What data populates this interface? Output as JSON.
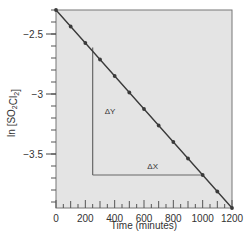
{
  "chart_data": {
    "type": "line",
    "title": "",
    "xlabel": "Time (minutes)",
    "ylabel": "ln [SO2Cl2]",
    "ylabel_parts": {
      "pre": "ln [SO",
      "sub1": "2",
      "mid": "Cl",
      "sub2": "2",
      "post": "]"
    },
    "xlim": [
      0,
      1200
    ],
    "ylim": [
      -3.95,
      -2.3
    ],
    "x_ticks": [
      0,
      200,
      400,
      600,
      800,
      1000,
      1200
    ],
    "x_tick_labels": [
      "0",
      "200",
      "400",
      "600",
      "800",
      "1000",
      "1200"
    ],
    "x_minor_step": 50,
    "y_ticks": [
      -2.5,
      -3,
      -3.5
    ],
    "y_tick_labels": [
      "-2.5",
      "-3",
      "-3.5"
    ],
    "y_minor_step": 0.1,
    "grid": false,
    "series": [
      {
        "name": "ln [SO2Cl2] vs time",
        "x": [
          0,
          100,
          200,
          300,
          400,
          500,
          600,
          700,
          800,
          900,
          1000,
          1100,
          1200
        ],
        "y": [
          -2.3,
          -2.4375,
          -2.575,
          -2.7125,
          -2.85,
          -2.9875,
          -3.125,
          -3.2625,
          -3.4,
          -3.5375,
          -3.675,
          -3.8125,
          -3.95
        ]
      }
    ],
    "annotations": [
      {
        "text": "ΔY",
        "kind": "rise",
        "x": 250,
        "y_from": -2.6125,
        "y_to": -3.675
      },
      {
        "text": "ΔX",
        "kind": "run",
        "y": -3.675,
        "x_from": 250,
        "x_to": 1000
      }
    ],
    "colors": {
      "plot_bg": "#e4e4e4",
      "line": "#3a3a3a",
      "frame": "#777777"
    }
  }
}
